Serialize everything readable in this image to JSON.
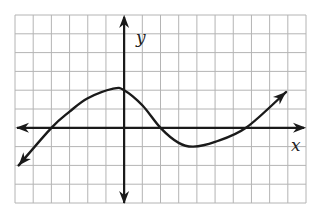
{
  "chart_data": {
    "type": "line",
    "title": "",
    "xlabel": "x",
    "ylabel": "y",
    "xlim": [
      -6,
      10
    ],
    "ylim": [
      -4,
      6
    ],
    "grid": true,
    "grid_step": 1,
    "tick_labels_shown": false,
    "axes_arrows": true,
    "colors": {
      "curve": "#1a1a1a",
      "axis": "#1a1a1a",
      "grid": "#b4b4b4"
    },
    "series": [
      {
        "name": "curve",
        "arrow_start": true,
        "arrow_end": true,
        "points": [
          [
            -5.8,
            -2.0
          ],
          [
            -4.0,
            0.0
          ],
          [
            -3.0,
            0.86
          ],
          [
            -2.0,
            1.57
          ],
          [
            -0.6,
            2.08
          ],
          [
            0.0,
            2.0
          ],
          [
            1.0,
            1.2
          ],
          [
            2.0,
            0.0
          ],
          [
            3.0,
            -0.8
          ],
          [
            3.8,
            -1.0
          ],
          [
            5.0,
            -0.75
          ],
          [
            6.7,
            0.0
          ],
          [
            8.9,
            1.9
          ]
        ]
      }
    ],
    "annotations": {
      "x_intercepts": [
        -4,
        2,
        6.7
      ],
      "y_intercept": 2,
      "local_max": [
        -0.6,
        2.08
      ],
      "local_min": [
        3.8,
        -1.0
      ]
    }
  }
}
